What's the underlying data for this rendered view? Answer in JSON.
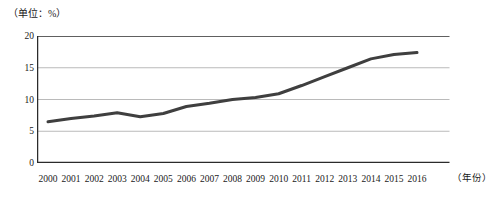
{
  "chart_data": {
    "type": "line",
    "title": "",
    "subtitle": "",
    "unit_label": "（单位：%）",
    "xlabel": "（年份）",
    "ylabel": "",
    "grid": true,
    "legend": false,
    "legend_position": "none",
    "xlim": [
      2000,
      2016
    ],
    "ylim": [
      0,
      20
    ],
    "y_ticks": [
      0,
      5,
      10,
      15,
      20
    ],
    "y_tick_labels": [
      "0",
      "5",
      "10",
      "15",
      "20"
    ],
    "categories": [
      "2000",
      "2001",
      "2002",
      "2003",
      "2004",
      "2005",
      "2006",
      "2007",
      "2008",
      "2009",
      "2010",
      "2011",
      "2012",
      "2013",
      "2014",
      "2015",
      "2016"
    ],
    "x": [
      2000,
      2001,
      2002,
      2003,
      2004,
      2005,
      2006,
      2007,
      2008,
      2009,
      2010,
      2011,
      2012,
      2013,
      2014,
      2015,
      2016
    ],
    "values": [
      6.5,
      7.0,
      7.4,
      7.9,
      7.3,
      7.8,
      8.9,
      9.4,
      10.0,
      10.3,
      10.9,
      12.2,
      13.6,
      15.0,
      16.4,
      17.1,
      17.4
    ],
    "series": [
      {
        "name": "",
        "color": "#3f3f3f",
        "line_width": 3,
        "values": [
          6.5,
          7.0,
          7.4,
          7.9,
          7.3,
          7.8,
          8.9,
          9.4,
          10.0,
          10.3,
          10.9,
          12.2,
          13.6,
          15.0,
          16.4,
          17.1,
          17.4
        ]
      }
    ],
    "colors": {
      "line": "#3f3f3f",
      "grid": "#a8a8a8",
      "axis": "#2b2b2b",
      "background": "#ffffff"
    }
  }
}
